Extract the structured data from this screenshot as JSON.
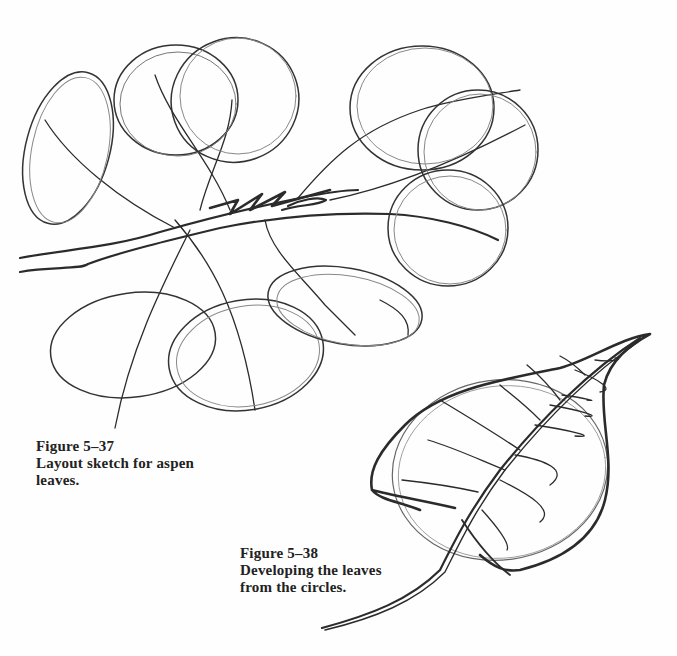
{
  "page": {
    "background": "#fefefe",
    "ink_color": "#2a2a2a"
  },
  "figures": [
    {
      "id": "fig-5-37",
      "number": "Figure 5–37",
      "caption_lines": [
        "Layout sketch for aspen",
        "leaves."
      ],
      "description": "Pencil layout sketch of a branch with loosely drawn overlapping circles/ellipses for aspen leaves"
    },
    {
      "id": "fig-5-38",
      "number": "Figure 5–38",
      "caption_lines": [
        "Developing the leaves",
        "from the circles."
      ],
      "description": "Pencil drawing of a single heart-shaped aspen leaf with stem and veins developed over a circle"
    }
  ]
}
